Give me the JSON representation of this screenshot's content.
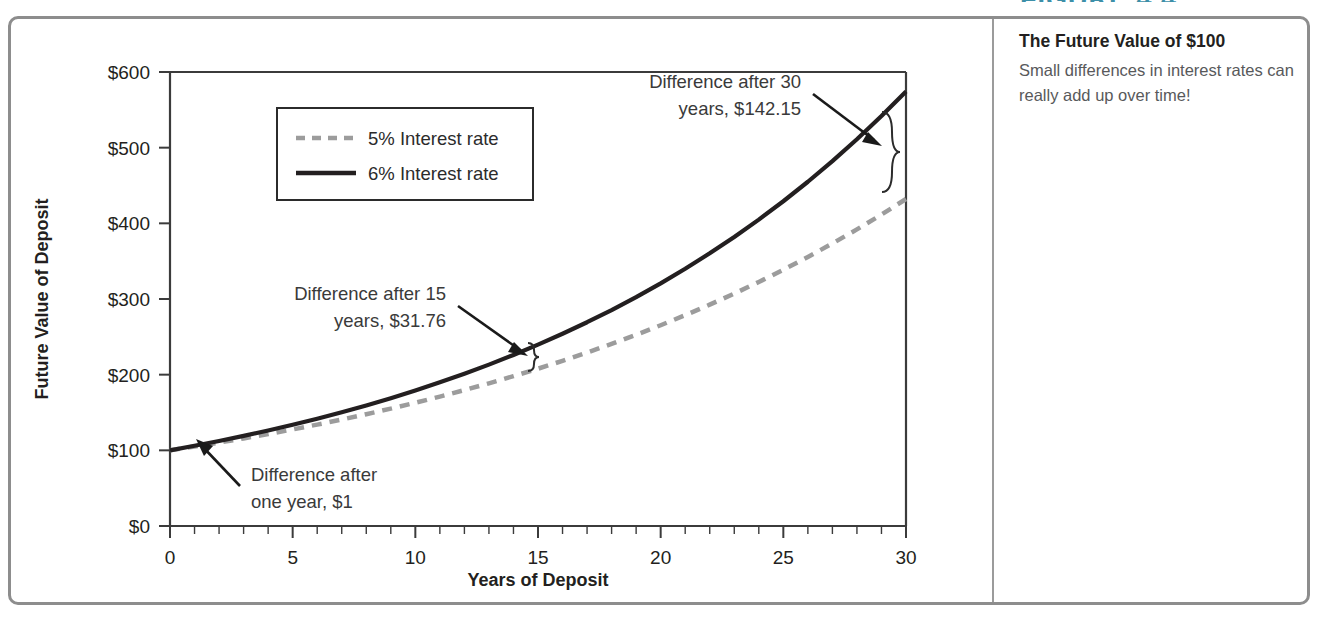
{
  "figure": {
    "number_label": "FIGURE 4.4",
    "caption_title": "The Future Value of $100",
    "caption_body": "Small differences in interest rates can really add up over time!"
  },
  "legend": {
    "entries": [
      {
        "label": "5% Interest rate",
        "style": "dashed",
        "color": "#9c9c9c"
      },
      {
        "label": "6% Interest rate",
        "style": "solid",
        "color": "#231f20"
      }
    ]
  },
  "annotations": {
    "one_year": "Difference after one year, $1",
    "one_year_line1": "Difference after",
    "one_year_line2": "one year, $1",
    "fifteen_year_line1": "Difference after 15",
    "fifteen_year_line2": "years, $31.76",
    "thirty_year_line1": "Difference after 30",
    "thirty_year_line2": "years, $142.15"
  },
  "axes": {
    "x_title": "Years of Deposit",
    "y_title": "Future Value of Deposit",
    "x_ticks": [
      "0",
      "5",
      "10",
      "15",
      "20",
      "25",
      "30"
    ],
    "y_ticks": [
      "$0",
      "$100",
      "$200",
      "$300",
      "$400",
      "$500",
      "$600"
    ]
  },
  "chart_data": {
    "type": "line",
    "title": "The Future Value of $100",
    "xlabel": "Years of Deposit",
    "ylabel": "Future Value of Deposit",
    "xlim": [
      0,
      30
    ],
    "ylim": [
      0,
      600
    ],
    "xticks": [
      0,
      5,
      10,
      15,
      20,
      25,
      30
    ],
    "yticks": [
      0,
      100,
      200,
      300,
      400,
      500,
      600
    ],
    "xtick_labels": [
      "0",
      "5",
      "10",
      "15",
      "20",
      "25",
      "30"
    ],
    "ytick_labels": [
      "$0",
      "$100",
      "$200",
      "$300",
      "$400",
      "$500",
      "$600"
    ],
    "x_minor_tick_step": 1,
    "grid": false,
    "legend_position": "upper-left-inside",
    "x": [
      0,
      1,
      2,
      3,
      4,
      5,
      6,
      7,
      8,
      9,
      10,
      11,
      12,
      13,
      14,
      15,
      16,
      17,
      18,
      19,
      20,
      21,
      22,
      23,
      24,
      25,
      26,
      27,
      28,
      29,
      30
    ],
    "series": [
      {
        "name": "5% Interest rate",
        "style": "dashed",
        "color": "#9c9c9c",
        "values": [
          100.0,
          105.0,
          110.25,
          115.76,
          121.55,
          127.63,
          134.01,
          140.71,
          147.75,
          155.13,
          162.89,
          171.03,
          179.59,
          188.56,
          197.99,
          207.89,
          218.29,
          229.2,
          240.66,
          252.7,
          265.33,
          278.6,
          292.53,
          307.15,
          322.51,
          338.64,
          355.57,
          373.35,
          392.01,
          411.61,
          432.19
        ]
      },
      {
        "name": "6% Interest rate",
        "style": "solid",
        "color": "#231f20",
        "values": [
          100.0,
          106.0,
          112.36,
          119.1,
          126.25,
          133.82,
          141.85,
          150.36,
          159.38,
          168.95,
          179.08,
          189.83,
          201.22,
          213.29,
          226.09,
          239.66,
          254.04,
          269.28,
          285.43,
          302.56,
          320.71,
          339.96,
          360.35,
          381.97,
          404.89,
          429.19,
          454.94,
          482.23,
          511.17,
          541.84,
          574.35
        ]
      }
    ],
    "annotations": [
      {
        "label": "Difference after one year, $1",
        "year": 1,
        "difference": 1.0
      },
      {
        "label": "Difference after 15 years, $31.76",
        "year": 15,
        "difference": 31.76
      },
      {
        "label": "Difference after 30 years, $142.15",
        "year": 30,
        "difference": 142.15
      }
    ]
  }
}
